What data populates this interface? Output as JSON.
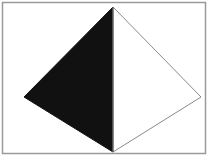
{
  "figure": {
    "colors": {
      "dark_face": "#111111",
      "light_face": "#ffffff",
      "edge": "#8a8a8a",
      "border": "#9a9a9a",
      "background": "#ffffff"
    },
    "faces": [
      {
        "name": "left-face",
        "shade": "dark"
      },
      {
        "name": "right-face",
        "shade": "light"
      }
    ],
    "caption": ""
  }
}
